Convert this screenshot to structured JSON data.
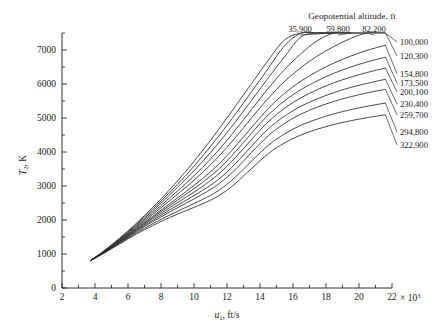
{
  "chart_data": {
    "type": "line",
    "title": "",
    "legend_title": "Geopotential altitude, ft",
    "legend_position": "right-of-curves",
    "grid": false,
    "xlabel": "u₁, ft/s",
    "ylabel": "T₂, K",
    "x_multiplier": "× 10³",
    "xlim": [
      2,
      22
    ],
    "ylim": [
      0,
      7500
    ],
    "xticks": [
      2,
      4,
      6,
      8,
      10,
      12,
      14,
      16,
      18,
      20,
      22
    ],
    "xticklabels": [
      "2",
      "4",
      "6",
      "8",
      "10",
      "12",
      "14",
      "16",
      "18",
      "20",
      "22"
    ],
    "yticks": [
      0,
      1000,
      2000,
      3000,
      4000,
      5000,
      6000,
      7000
    ],
    "yticklabels": [
      "0",
      "1000",
      "2000",
      "3000",
      "4000",
      "5000",
      "6000",
      "7000"
    ],
    "x_minor_tick_step": 1,
    "y_minor_tick_step": 500,
    "series": [
      {
        "name": "35,900",
        "label": "35,900",
        "label_placement": "above",
        "x": [
          3.7,
          4.5,
          5.5,
          6.5,
          7.5,
          8.5,
          9.5,
          10.5,
          11.5,
          12.5,
          13.5,
          14.5,
          15.5,
          16.5,
          17.5,
          18.5
        ],
        "y": [
          800,
          1080,
          1470,
          1900,
          2370,
          2880,
          3430,
          4030,
          4670,
          5340,
          6020,
          6700,
          7300,
          7500,
          7500,
          7500
        ]
      },
      {
        "name": "59,800",
        "label": "59,800",
        "label_placement": "above",
        "x": [
          3.7,
          4.5,
          5.5,
          6.5,
          7.5,
          8.5,
          9.5,
          10.5,
          11.5,
          12.5,
          13.5,
          14.5,
          15.5,
          16.5,
          17.5,
          18.5,
          19.5
        ],
        "y": [
          800,
          1070,
          1450,
          1870,
          2320,
          2800,
          3310,
          3870,
          4470,
          5110,
          5780,
          6460,
          7130,
          7500,
          7500,
          7500,
          7500
        ]
      },
      {
        "name": "82,200",
        "label": "82,200",
        "label_placement": "above",
        "x": [
          3.7,
          4.5,
          5.5,
          6.5,
          7.5,
          8.5,
          9.5,
          10.5,
          11.5,
          12.5,
          13.5,
          14.5,
          15.5,
          16.5,
          17.5,
          18.5,
          19.5,
          20.5
        ],
        "y": [
          800,
          1060,
          1430,
          1840,
          2270,
          2730,
          3200,
          3710,
          4270,
          4880,
          5530,
          6180,
          6810,
          7390,
          7500,
          7500,
          7500,
          7500
        ]
      },
      {
        "name": "100,000",
        "label": "100,000",
        "label_placement": "right",
        "x": [
          3.7,
          4.5,
          5.5,
          6.5,
          7.5,
          8.5,
          9.5,
          10.5,
          11.5,
          12.5,
          13.5,
          14.5,
          15.5,
          16.5,
          17.5,
          18.5,
          19.5,
          20.5,
          21.6
        ],
        "y": [
          800,
          1055,
          1415,
          1810,
          2215,
          2640,
          3070,
          3540,
          4060,
          4640,
          5260,
          5870,
          6430,
          6900,
          7280,
          7500,
          7500,
          7500,
          7500
        ]
      },
      {
        "name": "120,300",
        "label": "120,300",
        "label_placement": "right",
        "x": [
          3.7,
          4.5,
          5.5,
          6.5,
          7.5,
          8.5,
          9.5,
          10.5,
          11.5,
          12.5,
          13.5,
          14.5,
          15.5,
          16.5,
          17.5,
          18.5,
          19.5,
          20.5,
          21.6
        ],
        "y": [
          800,
          1050,
          1400,
          1780,
          2165,
          2560,
          2960,
          3390,
          3870,
          4420,
          5010,
          5580,
          6080,
          6490,
          6830,
          7110,
          7340,
          7500,
          7500
        ]
      },
      {
        "name": "154,800",
        "label": "154,800",
        "label_placement": "right",
        "x": [
          3.7,
          4.5,
          5.5,
          6.5,
          7.5,
          8.5,
          9.5,
          10.5,
          11.5,
          12.5,
          13.5,
          14.5,
          15.5,
          16.5,
          17.5,
          18.5,
          19.5,
          20.5,
          21.6
        ],
        "y": [
          800,
          1045,
          1385,
          1750,
          2110,
          2470,
          2830,
          3210,
          3640,
          4160,
          4730,
          5280,
          5730,
          6090,
          6380,
          6620,
          6820,
          6990,
          7140
        ]
      },
      {
        "name": "173,500",
        "label": "173,500",
        "label_placement": "right",
        "x": [
          3.7,
          4.5,
          5.5,
          6.5,
          7.5,
          8.5,
          9.5,
          10.5,
          11.5,
          12.5,
          13.5,
          14.5,
          15.5,
          16.5,
          17.5,
          18.5,
          19.5,
          20.5,
          21.6
        ],
        "y": [
          800,
          1040,
          1375,
          1730,
          2075,
          2415,
          2750,
          3100,
          3500,
          4000,
          4560,
          5090,
          5510,
          5840,
          6100,
          6320,
          6500,
          6650,
          6790
        ]
      },
      {
        "name": "200,100",
        "label": "200,100",
        "label_placement": "right",
        "x": [
          3.7,
          4.5,
          5.5,
          6.5,
          7.5,
          8.5,
          9.5,
          10.5,
          11.5,
          12.5,
          13.5,
          14.5,
          15.5,
          16.5,
          17.5,
          18.5,
          19.5,
          20.5,
          21.6
        ],
        "y": [
          800,
          1035,
          1362,
          1705,
          2035,
          2355,
          2665,
          2985,
          3355,
          3830,
          4375,
          4890,
          5290,
          5600,
          5840,
          6040,
          6200,
          6340,
          6470
        ]
      },
      {
        "name": "230,400",
        "label": "230,400",
        "label_placement": "right",
        "x": [
          3.7,
          4.5,
          5.5,
          6.5,
          7.5,
          8.5,
          9.5,
          10.5,
          11.5,
          12.5,
          13.5,
          14.5,
          15.5,
          16.5,
          17.5,
          18.5,
          19.5,
          20.5,
          21.6
        ],
        "y": [
          800,
          1030,
          1348,
          1680,
          1990,
          2290,
          2575,
          2865,
          3200,
          3650,
          4180,
          4680,
          5060,
          5350,
          5570,
          5750,
          5900,
          6020,
          6140
        ]
      },
      {
        "name": "259,700",
        "label": "259,700",
        "label_placement": "right",
        "x": [
          3.7,
          4.5,
          5.5,
          6.5,
          7.5,
          8.5,
          9.5,
          10.5,
          11.5,
          12.5,
          13.5,
          14.5,
          15.5,
          16.5,
          17.5,
          18.5,
          19.5,
          20.5,
          21.6
        ],
        "y": [
          800,
          1025,
          1335,
          1655,
          1950,
          2230,
          2490,
          2755,
          3060,
          3485,
          3995,
          4480,
          4845,
          5120,
          5325,
          5490,
          5625,
          5740,
          5845
        ]
      },
      {
        "name": "294,800",
        "label": "294,800",
        "label_placement": "right",
        "x": [
          3.7,
          4.5,
          5.5,
          6.5,
          7.5,
          8.5,
          9.5,
          10.5,
          11.5,
          12.5,
          13.5,
          14.5,
          15.5,
          16.5,
          17.5,
          18.5,
          19.5,
          20.5,
          21.6
        ],
        "y": [
          800,
          1018,
          1315,
          1618,
          1890,
          2140,
          2370,
          2600,
          2870,
          3260,
          3740,
          4195,
          4535,
          4790,
          4975,
          5125,
          5245,
          5345,
          5440
        ]
      },
      {
        "name": "322,900",
        "label": "322,900",
        "label_placement": "right",
        "x": [
          3.7,
          4.5,
          5.5,
          6.5,
          7.5,
          8.5,
          9.5,
          10.5,
          11.5,
          12.5,
          13.5,
          14.5,
          15.5,
          16.5,
          17.5,
          18.5,
          19.5,
          20.5,
          21.6
        ],
        "y": [
          800,
          1012,
          1298,
          1585,
          1838,
          2068,
          2272,
          2472,
          2712,
          3070,
          3520,
          3950,
          4270,
          4505,
          4675,
          4810,
          4920,
          5010,
          5095
        ]
      }
    ]
  }
}
